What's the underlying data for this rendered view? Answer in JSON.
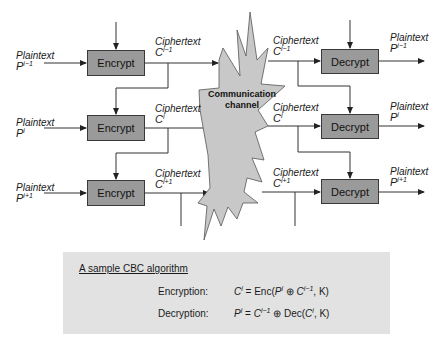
{
  "diagram": {
    "colors": {
      "block_fill": "#9a9a9a",
      "channel_fill": "#c8c8c8",
      "formula_bg": "#e2e2e2",
      "line": "#333333"
    },
    "encrypt_label": "Encrypt",
    "decrypt_label": "Decrypt",
    "channel_label_line1": "Communication",
    "channel_label_line2": "channel",
    "rows": [
      {
        "plaintext_in": {
          "word": "Plaintext",
          "sym": "P",
          "sup": "i−1"
        },
        "ciphertext_enc": {
          "word": "Ciphertext",
          "sym": "C",
          "sup": "i−1"
        },
        "ciphertext_dec": {
          "word": "Ciphertext",
          "sym": "C",
          "sup": "i−1"
        },
        "plaintext_out": {
          "word": "Plaintext",
          "sym": "P",
          "sup": "i−1"
        }
      },
      {
        "plaintext_in": {
          "word": "Plaintext",
          "sym": "P",
          "sup": "i"
        },
        "ciphertext_enc": {
          "word": "Ciphertext",
          "sym": "C",
          "sup": "i"
        },
        "ciphertext_dec": {
          "word": "Ciphertext",
          "sym": "C",
          "sup": "i"
        },
        "plaintext_out": {
          "word": "Plaintext",
          "sym": "P",
          "sup": "i"
        }
      },
      {
        "plaintext_in": {
          "word": "Plaintext",
          "sym": "P",
          "sup": "i+1"
        },
        "ciphertext_enc": {
          "word": "Ciphertext",
          "sym": "C",
          "sup": "i+1"
        },
        "ciphertext_dec": {
          "word": "Ciphertext",
          "sym": "C",
          "sup": "i+1"
        },
        "plaintext_out": {
          "word": "Plaintext",
          "sym": "P",
          "sup": "i+1"
        }
      }
    ]
  },
  "formula": {
    "title": "A sample CBC algorithm",
    "encryption": {
      "name": "Encryption:",
      "lhs": "C",
      "lhs_sup": "i",
      "eq": " = Enc(",
      "p": "P",
      "p_sup": "i",
      "op": " ⊕ ",
      "c": "C",
      "c_sup": "i−1",
      "tail": ", K)"
    },
    "decryption": {
      "name": "Decryption:",
      "lhs": "P",
      "lhs_sup": "i",
      "eq": " = ",
      "c": "C",
      "c_sup": "i−1",
      "op": " ⊕ Dec(",
      "c2": "C",
      "c2_sup": "i",
      "tail": ", K)"
    }
  }
}
